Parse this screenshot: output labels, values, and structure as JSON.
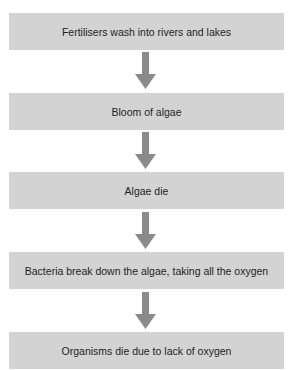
{
  "flowchart": {
    "steps": [
      {
        "label": "Fertilisers wash into rivers and lakes"
      },
      {
        "label": "Bloom of algae"
      },
      {
        "label": "Algae die"
      },
      {
        "label": "Bacteria break down the algae, taking all the oxygen"
      },
      {
        "label": "Organisms die due to lack of oxygen"
      }
    ],
    "colors": {
      "box_fill": "#d3d3d3",
      "arrow_fill": "#8a8a8a",
      "text": "#1e1e1e"
    }
  }
}
